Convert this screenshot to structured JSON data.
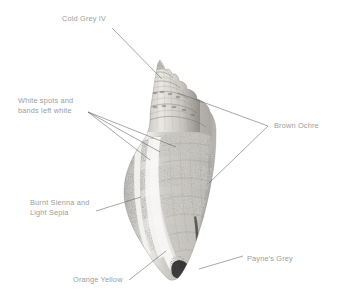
{
  "illustration": {
    "subject": "shell-illustration",
    "description": "Pencil and watercolour study of a spiral sea shell with annotated colour-mixing notes"
  },
  "annotations": [
    {
      "id": "cold-grey",
      "text": "Cold Grey IV",
      "name": "annotation-cold-grey-iv",
      "leader": [
        [
          112,
          28
        ],
        [
          162,
          79
        ]
      ]
    },
    {
      "id": "white-spots",
      "text": "White spots and\nbands left white",
      "name": "annotation-white-spots",
      "leader": [
        [
          88,
          112
        ],
        [
          176,
          147
        ]
      ]
    },
    {
      "id": "burnt-sienna",
      "text": "Burnt Sienna and\nLight Sepia",
      "name": "annotation-burnt-sienna-light-sepia",
      "leader": [
        [
          96,
          211
        ],
        [
          141,
          197
        ]
      ]
    },
    {
      "id": "brown-ochre",
      "text": "Brown Ochre",
      "name": "annotation-brown-ochre",
      "leader": [
        [
          268,
          126
        ],
        [
          178,
          93
        ]
      ]
    },
    {
      "id": "paynes-grey",
      "text": "Payne's Grey",
      "name": "annotation-paynes-grey",
      "leader": [
        [
          243,
          256
        ],
        [
          199,
          269
        ]
      ]
    },
    {
      "id": "orange-yellow",
      "text": "Orange Yellow",
      "name": "annotation-orange-yellow",
      "leader": [
        [
          129,
          280
        ],
        [
          166,
          251
        ]
      ]
    }
  ],
  "palette": {
    "label_text": "#9b9da2",
    "leader_line": "#5d5f63",
    "background": "#ffffff",
    "shell_light": "#dcdcda",
    "shell_mid": "#9a978f",
    "shell_dark": "#4a4944",
    "shell_deepest": "#232322"
  }
}
